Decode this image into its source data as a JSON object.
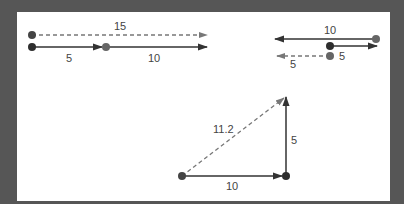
{
  "colors": {
    "background": "#565656",
    "panel": "#ffffff",
    "vector": "#333333",
    "resultant": "#777777",
    "dot_dark": "#2e2e2e",
    "dot_light": "#666666"
  },
  "diagrams": [
    {
      "name": "collinear-same-direction",
      "vectors": [
        {
          "label": "5",
          "magnitude": 5,
          "direction": "right",
          "style": "solid"
        },
        {
          "label": "10",
          "magnitude": 10,
          "direction": "right",
          "style": "solid"
        },
        {
          "label": "15",
          "magnitude": 15,
          "direction": "right",
          "style": "dashed",
          "resultant": true
        }
      ]
    },
    {
      "name": "collinear-opposite-direction",
      "vectors": [
        {
          "label": "10",
          "magnitude": 10,
          "direction": "left",
          "style": "solid"
        },
        {
          "label": "5",
          "magnitude": 5,
          "direction": "right",
          "style": "solid"
        },
        {
          "label": "5",
          "magnitude": 5,
          "direction": "left",
          "style": "dashed",
          "resultant": true
        }
      ]
    },
    {
      "name": "perpendicular",
      "vectors": [
        {
          "label": "10",
          "magnitude": 10,
          "direction": "right",
          "style": "solid"
        },
        {
          "label": "5",
          "magnitude": 5,
          "direction": "up",
          "style": "solid"
        },
        {
          "label": "11.2",
          "magnitude": 11.2,
          "direction": "diagonal",
          "style": "dashed",
          "resultant": true
        }
      ]
    }
  ]
}
